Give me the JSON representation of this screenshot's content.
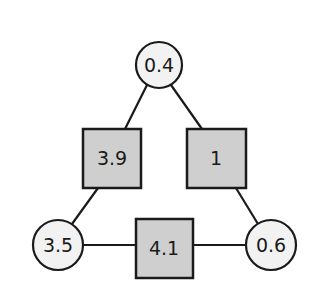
{
  "diagram": {
    "type": "graph",
    "colors": {
      "stroke": "#1a1a1a",
      "circle_fill": "#f2f2f2",
      "square_fill": "#cfcfcf",
      "background": "#ffffff"
    },
    "nodes": [
      {
        "id": "top",
        "shape": "circle",
        "label": "0.4",
        "cx": 159,
        "cy": 65,
        "r": 23
      },
      {
        "id": "left-mid",
        "shape": "square",
        "label": "3.9",
        "x": 83,
        "y": 129,
        "w": 58,
        "h": 59
      },
      {
        "id": "right-mid",
        "shape": "square",
        "label": "1",
        "x": 187,
        "y": 129,
        "w": 59,
        "h": 59
      },
      {
        "id": "bottom-left",
        "shape": "circle",
        "label": "3.5",
        "cx": 58,
        "cy": 245,
        "r": 25
      },
      {
        "id": "bottom-mid",
        "shape": "square",
        "label": "4.1",
        "x": 136,
        "y": 219,
        "w": 57,
        "h": 59
      },
      {
        "id": "bottom-right",
        "shape": "circle",
        "label": "0.6",
        "cx": 271,
        "cy": 245,
        "r": 25
      }
    ],
    "edges": [
      {
        "from": "top",
        "to": "left-mid"
      },
      {
        "from": "top",
        "to": "right-mid"
      },
      {
        "from": "left-mid",
        "to": "bottom-left"
      },
      {
        "from": "right-mid",
        "to": "bottom-right"
      },
      {
        "from": "bottom-left",
        "to": "bottom-mid"
      },
      {
        "from": "bottom-mid",
        "to": "bottom-right"
      }
    ]
  }
}
